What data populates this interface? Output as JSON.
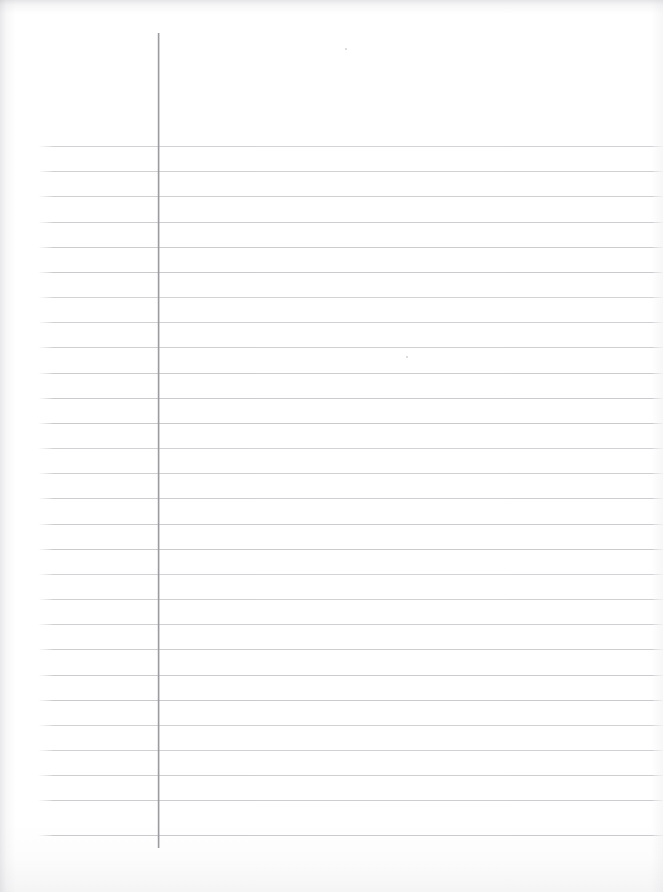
{
  "document": {
    "kind": "scanned-ruled-notebook-paper",
    "title": "Blank Lined Paper (Scan)",
    "page_width": 663,
    "page_height": 892,
    "content_text": "",
    "handwriting_present": "none",
    "orientation": "portrait"
  },
  "colors": {
    "paper": "#ffffff",
    "rule_line": "#c9c9ce",
    "margin_line": "#9b9ba1",
    "scan_shadow": "#a8a8af"
  },
  "margin_rule": {
    "name": "vertical-margin-rule",
    "x": 158,
    "y_start": 33,
    "y_end": 848,
    "thickness": 1.4,
    "color": "#9b9ba1"
  },
  "ruling": {
    "line_count": 28,
    "first_line_y": 146,
    "spacing": 25.2,
    "x_start": 52,
    "x_end": 653,
    "thickness": 1,
    "color": "#c9c9ce",
    "line_y_positions": [
      146,
      171,
      196,
      222,
      247,
      272,
      297,
      322,
      347,
      373,
      398,
      423,
      448,
      473,
      498,
      524,
      549,
      574,
      599,
      624,
      649,
      675,
      700,
      725,
      750,
      775,
      800,
      835
    ]
  },
  "artifacts": {
    "specks": [
      {
        "name": "speck-upper",
        "x": 345,
        "y": 48,
        "size": 2
      },
      {
        "name": "speck-mid",
        "x": 406,
        "y": 356,
        "size": 2
      }
    ],
    "edge_shading": [
      "top",
      "left",
      "bottom",
      "right"
    ]
  }
}
